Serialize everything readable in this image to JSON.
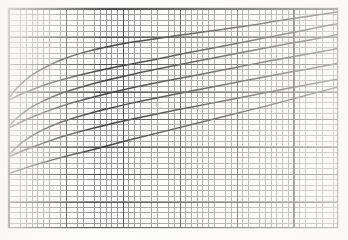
{
  "figure": {
    "title": "",
    "caption": "",
    "background_color": "#ffffff",
    "ink_color": "#141414",
    "grid_minor_color": "#606060",
    "grid_major_color": "#171717",
    "border_color": "#2a2a2a"
  },
  "chart_data": {
    "type": "line",
    "title": "",
    "subtitle": "",
    "xlabel": "",
    "ylabel": "",
    "xlim": [
      0,
      330
    ],
    "ylim": [
      220,
      0
    ],
    "grid": true,
    "grid_minor_spacing_x": 5.69,
    "grid_minor_spacing_y": 5.5,
    "grid_major_spacing_x": 56.9,
    "grid_major_spacing_y": 27.5,
    "grid_major_columns": 6,
    "grid_major_rows": 8,
    "legend": "none",
    "annotations": [],
    "tick_labels_x": [],
    "tick_labels_y": [],
    "series": [
      {
        "name": "curve-1-upper",
        "stroke_width": 1.5,
        "points": [
          [
            0,
            90
          ],
          [
            6,
            82
          ],
          [
            14,
            74
          ],
          [
            24,
            66
          ],
          [
            38,
            58
          ],
          [
            56,
            50
          ],
          [
            78,
            43
          ],
          [
            104,
            37
          ],
          [
            134,
            32
          ],
          [
            168,
            27
          ],
          [
            204,
            22
          ],
          [
            240,
            17
          ],
          [
            276,
            11
          ],
          [
            310,
            6
          ],
          [
            330,
            3
          ]
        ]
      },
      {
        "name": "curve-1-lower",
        "stroke_width": 1.5,
        "points": [
          [
            0,
            92
          ],
          [
            10,
            87
          ],
          [
            22,
            82
          ],
          [
            38,
            76
          ],
          [
            58,
            70
          ],
          [
            82,
            64
          ],
          [
            110,
            58
          ],
          [
            142,
            52
          ],
          [
            176,
            45
          ],
          [
            212,
            38
          ],
          [
            248,
            31
          ],
          [
            284,
            24
          ],
          [
            314,
            18
          ],
          [
            330,
            15
          ]
        ]
      },
      {
        "name": "curve-2-upper",
        "stroke_width": 1.5,
        "points": [
          [
            0,
            118
          ],
          [
            8,
            110
          ],
          [
            18,
            102
          ],
          [
            32,
            94
          ],
          [
            50,
            86
          ],
          [
            72,
            79
          ],
          [
            98,
            72
          ],
          [
            128,
            65
          ],
          [
            162,
            58
          ],
          [
            198,
            51
          ],
          [
            234,
            44
          ],
          [
            270,
            37
          ],
          [
            304,
            31
          ],
          [
            330,
            26
          ]
        ]
      },
      {
        "name": "curve-2-lower",
        "stroke_width": 1.5,
        "points": [
          [
            0,
            120
          ],
          [
            12,
            114
          ],
          [
            26,
            108
          ],
          [
            44,
            101
          ],
          [
            66,
            94
          ],
          [
            92,
            87
          ],
          [
            122,
            80
          ],
          [
            156,
            73
          ],
          [
            192,
            66
          ],
          [
            228,
            59
          ],
          [
            264,
            52
          ],
          [
            298,
            46
          ],
          [
            330,
            40
          ]
        ]
      },
      {
        "name": "curve-3-upper",
        "stroke_width": 1.5,
        "points": [
          [
            0,
            147
          ],
          [
            8,
            139
          ],
          [
            18,
            131
          ],
          [
            32,
            123
          ],
          [
            50,
            115
          ],
          [
            72,
            108
          ],
          [
            98,
            101
          ],
          [
            128,
            94
          ],
          [
            162,
            87
          ],
          [
            198,
            80
          ],
          [
            234,
            73
          ],
          [
            270,
            66
          ],
          [
            304,
            60
          ],
          [
            330,
            55
          ]
        ]
      },
      {
        "name": "curve-3-lower",
        "stroke_width": 1.5,
        "points": [
          [
            0,
            149
          ],
          [
            14,
            143
          ],
          [
            30,
            137
          ],
          [
            50,
            130
          ],
          [
            74,
            123
          ],
          [
            102,
            116
          ],
          [
            134,
            109
          ],
          [
            168,
            102
          ],
          [
            204,
            95
          ],
          [
            240,
            88
          ],
          [
            276,
            81
          ],
          [
            308,
            75
          ],
          [
            330,
            71
          ]
        ]
      },
      {
        "name": "curve-4-baseline",
        "stroke_width": 1.4,
        "points": [
          [
            0,
            166
          ],
          [
            24,
            158
          ],
          [
            52,
            150
          ],
          [
            84,
            142
          ],
          [
            118,
            133
          ],
          [
            154,
            124
          ],
          [
            190,
            115
          ],
          [
            226,
            106
          ],
          [
            262,
            97
          ],
          [
            296,
            88
          ],
          [
            330,
            79
          ]
        ]
      }
    ]
  },
  "specks": [
    {
      "x": 61,
      "y": 38,
      "r": 1.4
    },
    {
      "x": 148,
      "y": 96,
      "r": 1.6
    },
    {
      "x": 204,
      "y": 130,
      "r": 1.3
    },
    {
      "x": 255,
      "y": 168,
      "r": 1.5
    },
    {
      "x": 96,
      "y": 186,
      "r": 1.2
    },
    {
      "x": 298,
      "y": 74,
      "r": 1.3
    },
    {
      "x": 33,
      "y": 152,
      "r": 1.2
    },
    {
      "x": 176,
      "y": 52,
      "r": 1.1
    }
  ]
}
